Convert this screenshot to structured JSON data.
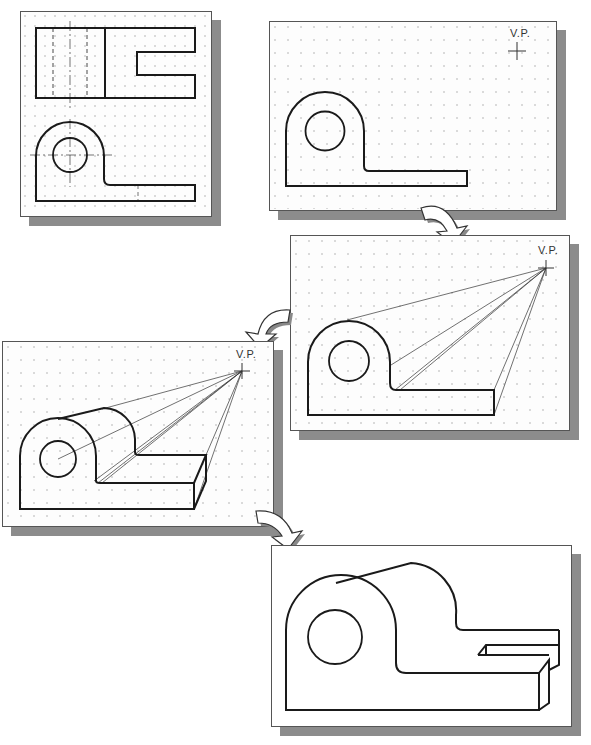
{
  "figure": {
    "panels": [
      {
        "id": "orthographic-views",
        "label": "",
        "grid": true
      },
      {
        "id": "step-1-front-view-with-vp",
        "label": "V.P.",
        "grid": true
      },
      {
        "id": "step-2-projection-lines",
        "label": "V.P.",
        "grid": true
      },
      {
        "id": "step-3-depth-construction",
        "label": "V.P.",
        "grid": true
      },
      {
        "id": "step-4-final-perspective",
        "label": "",
        "grid": false
      }
    ],
    "vanishing_point_label": "V.P.",
    "colors": {
      "line": "#1a1a1a",
      "grid_dot": "#9a9a9a",
      "shadow": "#8c8c8c",
      "sheet": "#fdfdfd"
    }
  }
}
